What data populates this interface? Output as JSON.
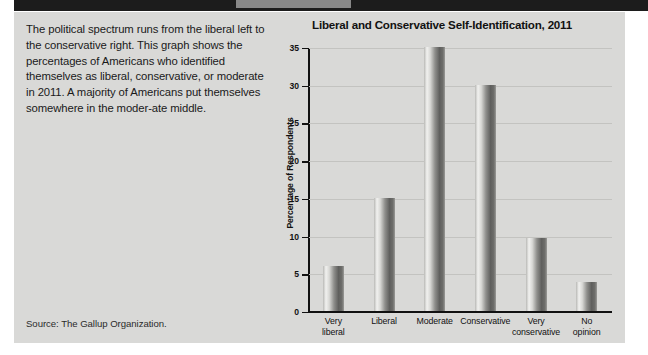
{
  "figure": {
    "caption_text": "The political spectrum runs from the liberal left to the conservative right. This graph shows the percentages of Americans who identified themselves as liberal, conservative, or moderate in 2011. A majority of Americans put themselves somewhere in the moder-ate middle.",
    "source_note": "Source: The Gallup Organization.",
    "paper_color": "#d9d9d7",
    "header_band_color": "#1c1c1c"
  },
  "chart_data": {
    "type": "bar",
    "title": "Liberal and Conservative Self-Identification, 2011",
    "xlabel": "",
    "ylabel": "Percentage of Respondents",
    "categories": [
      "Very liberal",
      "Liberal",
      "Moderate",
      "Conservative",
      "Very conservative",
      "No opinion"
    ],
    "category_lines": [
      [
        "Very",
        "liberal"
      ],
      [
        "Liberal",
        ""
      ],
      [
        "Moderate",
        ""
      ],
      [
        "Conservative",
        ""
      ],
      [
        "Very",
        "conservative"
      ],
      [
        "No",
        "opinion"
      ]
    ],
    "values": [
      6,
      15,
      35,
      30,
      9.7,
      3.8
    ],
    "ylim": [
      0,
      35
    ],
    "yticks": [
      0,
      5,
      10,
      15,
      20,
      25,
      30,
      35
    ],
    "ytick_labels": [
      "0",
      "5",
      "10",
      "15",
      "20",
      "25",
      "30",
      "35"
    ],
    "grid": true,
    "legend": "none",
    "bar_color": "#7a7a77",
    "axis_color": "#111111",
    "grid_color": "#c3c3c0"
  }
}
